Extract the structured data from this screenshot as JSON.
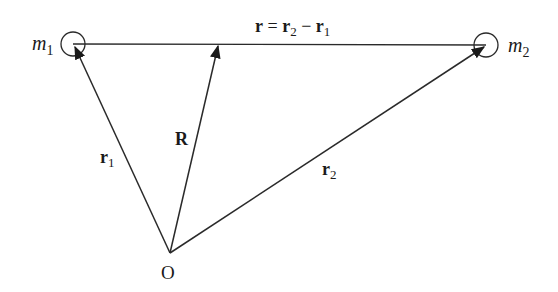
{
  "diagram": {
    "title": "",
    "points": {
      "origin": {
        "label": "O",
        "x": 170,
        "y": 253
      },
      "m1": {
        "label": "m",
        "sub": "1",
        "x": 73,
        "y": 44,
        "radius": 12
      },
      "m2": {
        "label": "m",
        "sub": "2",
        "x": 486,
        "y": 45,
        "radius": 12
      },
      "R_tip": {
        "x": 218,
        "y": 45
      }
    },
    "vectors": [
      {
        "id": "r1",
        "label": "r",
        "sub": "1",
        "from": "O",
        "to": "m1"
      },
      {
        "id": "R",
        "label": "R",
        "from": "O",
        "to": "center-of-mass point on line"
      },
      {
        "id": "r2",
        "label": "r",
        "sub": "2",
        "from": "O",
        "to": "m2"
      }
    ],
    "relative_label": {
      "lhs": "r",
      "eq": " = ",
      "a": "r",
      "a_sub": "2",
      "minus": " − ",
      "b": "r",
      "b_sub": "1"
    },
    "colors": {
      "line": "#2a2a2a",
      "text": "#1a1a1a",
      "background": "#ffffff"
    }
  }
}
